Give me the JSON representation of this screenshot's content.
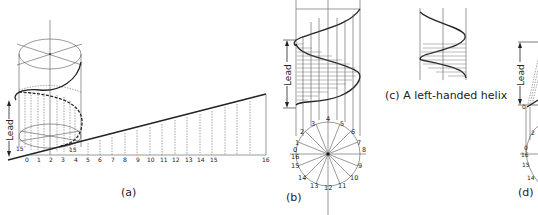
{
  "figure": {
    "panels": [
      {
        "id": "a",
        "caption": "(a)",
        "lead_label": "Lead",
        "development_ticks": [
          "0",
          "1",
          "2",
          "3",
          "4",
          "5",
          "6",
          "7",
          "8",
          "9",
          "10",
          "11",
          "12",
          "13",
          "14",
          "15",
          "16"
        ],
        "cylinder_base_labels": [
          "15",
          "0",
          "1",
          "2",
          "3",
          "4",
          "5"
        ],
        "edge_tick_labels": [
          "16",
          "15",
          "14",
          "13",
          "12",
          "11",
          "10",
          "9",
          "8",
          "7",
          "6",
          "5",
          "4",
          "3",
          "2",
          "1"
        ]
      },
      {
        "id": "b",
        "caption": "(b)",
        "lead_label": "Lead",
        "circle_labels": [
          "0",
          "1",
          "2",
          "3",
          "4",
          "5",
          "6",
          "7",
          "8",
          "9",
          "10",
          "11",
          "12",
          "13",
          "14",
          "15",
          "16"
        ]
      },
      {
        "id": "c",
        "caption": "(c) A left-handed helix"
      },
      {
        "id": "d",
        "caption": "(d)",
        "lead_label": "Lead",
        "circle_labels": [
          "0",
          "1",
          "2",
          "16",
          "15",
          "14"
        ]
      }
    ]
  }
}
